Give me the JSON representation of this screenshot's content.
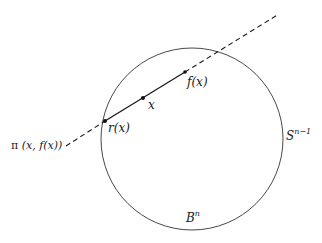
{
  "diagram": {
    "type": "geometric-figure",
    "labels": {
      "fx": "f(x)",
      "x": "x",
      "rx": "r(x)",
      "pi_prefix": "π",
      "pi_args": "(x, f(x))",
      "sphere_base": "S",
      "sphere_exp": "n−1",
      "ball_base": "B",
      "ball_exp": "n"
    },
    "circle": {
      "cx": 192,
      "cy": 139,
      "r": 91,
      "stroke": "#333333"
    },
    "line": {
      "dashed_start": [
        66,
        146
      ],
      "solid_start": [
        105,
        121
      ],
      "solid_end": [
        185,
        72
      ],
      "dashed_end": [
        279,
        14
      ],
      "stroke": "#1a1a1a"
    },
    "points": [
      {
        "name": "r(x)",
        "x": 105,
        "y": 121
      },
      {
        "name": "x",
        "x": 143,
        "y": 98
      },
      {
        "name": "f(x)",
        "x": 185,
        "y": 72
      }
    ]
  }
}
